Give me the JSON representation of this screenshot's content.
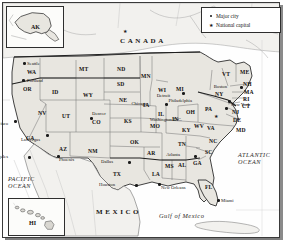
{
  "map": {
    "title": "United States of America reference map",
    "countries": [
      {
        "name": "CANADA",
        "x": 120,
        "y": 38
      },
      {
        "name": "MEXICO",
        "x": 96,
        "y": 209
      }
    ],
    "oceans": [
      {
        "name_line1": "PACIFIC",
        "name_line2": "OCEAN",
        "x": 8,
        "y": 176
      },
      {
        "name_line1": "ATLANTIC",
        "name_line2": "OCEAN",
        "x": 238,
        "y": 152
      },
      {
        "name": "Gulf of Mexico",
        "x": 159,
        "y": 213
      }
    ],
    "states": [
      {
        "code": "WA",
        "x": 27,
        "y": 70
      },
      {
        "code": "OR",
        "x": 23,
        "y": 87
      },
      {
        "code": "ID",
        "x": 52,
        "y": 90
      },
      {
        "code": "MT",
        "x": 79,
        "y": 67
      },
      {
        "code": "ND",
        "x": 117,
        "y": 67
      },
      {
        "code": "SD",
        "x": 117,
        "y": 82
      },
      {
        "code": "WY",
        "x": 83,
        "y": 93
      },
      {
        "code": "NE",
        "x": 119,
        "y": 98
      },
      {
        "code": "NV",
        "x": 38,
        "y": 111
      },
      {
        "code": "UT",
        "x": 62,
        "y": 114
      },
      {
        "code": "CO",
        "x": 92,
        "y": 120
      },
      {
        "code": "KS",
        "x": 124,
        "y": 119
      },
      {
        "code": "CA",
        "x": 26,
        "y": 136
      },
      {
        "code": "AZ",
        "x": 59,
        "y": 147
      },
      {
        "code": "NM",
        "x": 88,
        "y": 149
      },
      {
        "code": "OK",
        "x": 130,
        "y": 140
      },
      {
        "code": "TX",
        "x": 113,
        "y": 172
      },
      {
        "code": "MN",
        "x": 141,
        "y": 74
      },
      {
        "code": "IA",
        "x": 143,
        "y": 103
      },
      {
        "code": "MO",
        "x": 150,
        "y": 124
      },
      {
        "code": "AR",
        "x": 147,
        "y": 151
      },
      {
        "code": "LA",
        "x": 152,
        "y": 172
      },
      {
        "code": "WI",
        "x": 158,
        "y": 88
      },
      {
        "code": "IL",
        "x": 158,
        "y": 112
      },
      {
        "code": "MI",
        "x": 176,
        "y": 87
      },
      {
        "code": "IN",
        "x": 172,
        "y": 117
      },
      {
        "code": "OH",
        "x": 186,
        "y": 110
      },
      {
        "code": "KY",
        "x": 182,
        "y": 128
      },
      {
        "code": "TN",
        "x": 178,
        "y": 142
      },
      {
        "code": "MS",
        "x": 165,
        "y": 164
      },
      {
        "code": "AL",
        "x": 178,
        "y": 163
      },
      {
        "code": "GA",
        "x": 193,
        "y": 161
      },
      {
        "code": "FL",
        "x": 205,
        "y": 185
      },
      {
        "code": "SC",
        "x": 205,
        "y": 150
      },
      {
        "code": "NC",
        "x": 209,
        "y": 139
      },
      {
        "code": "VA",
        "x": 207,
        "y": 126
      },
      {
        "code": "WV",
        "x": 194,
        "y": 124
      },
      {
        "code": "PA",
        "x": 205,
        "y": 107
      },
      {
        "code": "MD",
        "x": 236,
        "y": 128
      },
      {
        "code": "DE",
        "x": 233,
        "y": 118
      },
      {
        "code": "NJ",
        "x": 232,
        "y": 110
      },
      {
        "code": "NY",
        "x": 215,
        "y": 92
      },
      {
        "code": "CT",
        "x": 242,
        "y": 104
      },
      {
        "code": "RI",
        "x": 243,
        "y": 97
      },
      {
        "code": "MA",
        "x": 244,
        "y": 90
      },
      {
        "code": "NH",
        "x": 243,
        "y": 82
      },
      {
        "code": "VT",
        "x": 222,
        "y": 72
      },
      {
        "code": "ME",
        "x": 240,
        "y": 70
      },
      {
        "code": "AK",
        "x": 31,
        "y": 25
      },
      {
        "code": "HI",
        "x": 30,
        "y": 220
      }
    ],
    "cities": [
      {
        "name": "Seattle",
        "x": 27,
        "y": 62,
        "dot_x": 23,
        "dot_y": 62,
        "label_side": "right",
        "type": "major"
      },
      {
        "name": "Portland",
        "x": 27,
        "y": 79,
        "dot_x": 22,
        "dot_y": 79,
        "label_side": "right",
        "type": "major"
      },
      {
        "name": "San Francisco",
        "x": 8,
        "y": 122,
        "dot_x": 14,
        "dot_y": 120,
        "label_side": "left",
        "type": "major"
      },
      {
        "name": "Los Angeles",
        "x": 8,
        "y": 155,
        "dot_x": 28,
        "dot_y": 156,
        "label_side": "left",
        "type": "major"
      },
      {
        "name": "Las Vegas",
        "x": 40,
        "y": 138,
        "dot_x": 46,
        "dot_y": 134,
        "label_side": "left",
        "type": "major"
      },
      {
        "name": "Phoenix",
        "x": 59,
        "y": 158,
        "dot_x": 57,
        "dot_y": 155,
        "label_side": "right",
        "type": "major"
      },
      {
        "name": "Denver",
        "x": 92,
        "y": 112,
        "dot_x": 90,
        "dot_y": 117,
        "label_side": "right",
        "type": "major"
      },
      {
        "name": "Dallas",
        "x": 113,
        "y": 160,
        "dot_x": 128,
        "dot_y": 161,
        "label_side": "left",
        "type": "major"
      },
      {
        "name": "Houston",
        "x": 115,
        "y": 183,
        "dot_x": 135,
        "dot_y": 184,
        "label_side": "left",
        "type": "major"
      },
      {
        "name": "Chicago",
        "x": 147,
        "y": 102,
        "dot_x": 165,
        "dot_y": 103,
        "label_side": "left",
        "type": "major"
      },
      {
        "name": "Detroit",
        "x": 170,
        "y": 94,
        "dot_x": 182,
        "dot_y": 92,
        "label_side": "left",
        "type": "major"
      },
      {
        "name": "Atlanta",
        "x": 180,
        "y": 153,
        "dot_x": 194,
        "dot_y": 155,
        "label_side": "left",
        "type": "major"
      },
      {
        "name": "New Orleans",
        "x": 161,
        "y": 186,
        "dot_x": 158,
        "dot_y": 183,
        "label_side": "right",
        "type": "major"
      },
      {
        "name": "Miami",
        "x": 221,
        "y": 199,
        "dot_x": 217,
        "dot_y": 199,
        "label_side": "right",
        "type": "major"
      },
      {
        "name": "New York",
        "x": 231,
        "y": 103,
        "dot_x": 228,
        "dot_y": 100,
        "label_side": "right",
        "type": "major"
      },
      {
        "name": "Boston",
        "x": 227,
        "y": 85,
        "dot_x": 240,
        "dot_y": 86,
        "label_side": "left",
        "type": "major"
      },
      {
        "name": "Philadelphia",
        "x": 192,
        "y": 99,
        "dot_x": 225,
        "dot_y": 107,
        "label_side": "left",
        "type": "major"
      },
      {
        "name": "Washington D.C.",
        "x": 182,
        "y": 118,
        "dot_x": 218,
        "dot_y": 116,
        "label_side": "left",
        "type": "capital"
      }
    ],
    "capital_markers": [
      {
        "name": "Ottawa",
        "x": 123,
        "y": 29
      },
      {
        "name": "Washington D.C.",
        "x": 214,
        "y": 114
      }
    ]
  },
  "legend": {
    "items": [
      {
        "symbol": "dot",
        "label": "Major city"
      },
      {
        "symbol": "star",
        "label": "National capital"
      }
    ]
  },
  "insets": [
    {
      "id": "alaska",
      "label": "AK"
    },
    {
      "id": "hawaii",
      "label": "HI"
    }
  ],
  "colors": {
    "land": "#e8e6e0",
    "water": "#ffffff",
    "border": "#3a3a3a",
    "state_border": "#6b6b6b",
    "text": "#14110f",
    "marker": "#1b1b1b"
  }
}
